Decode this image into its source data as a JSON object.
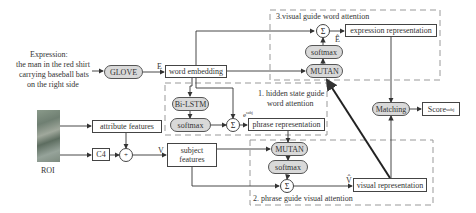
{
  "diagram": {
    "input_expression": {
      "label": "Expression:",
      "lines": [
        "the man in the red shirt",
        "carrying baseball bats",
        "on the right side"
      ]
    },
    "nodes": {
      "glove": "GLOVE",
      "word_embedding": "word embedding",
      "bilstm": "Bi-LSTM",
      "softmax_1": "softmax",
      "sigma_1": "Σ",
      "phrase_representation": "phrase representation",
      "attribute_features": "attribute features",
      "c4": "C4",
      "plus": "+",
      "subject_features_line1": "subject",
      "subject_features_line2": "features",
      "roi_label": "ROI",
      "mutan_2": "MUTAN",
      "softmax_2": "softmax",
      "sigma_2": "Σ",
      "visual_representation": "visual representation",
      "mutan_3": "MUTAN",
      "softmax_3": "softmax",
      "sigma_3": "Σ",
      "expression_representation": "expression representation",
      "matching": "Matching",
      "score": "Score",
      "score_subscript": "subj"
    },
    "edge_labels": {
      "E": "E",
      "E_hat": "Ê",
      "V": "V",
      "V_hat": "V̂",
      "e_subj": "e",
      "e_subj_sup": "subj"
    },
    "groups": {
      "group1_line1": "1. hidden state guide",
      "group1_line2": "word attention",
      "group2": "2. phrase guide visual attention",
      "group3": "3.visual guide word attention"
    },
    "colors": {
      "pill_fill": "#d9d9d9",
      "line": "#333333",
      "dashed": "#999999"
    }
  }
}
